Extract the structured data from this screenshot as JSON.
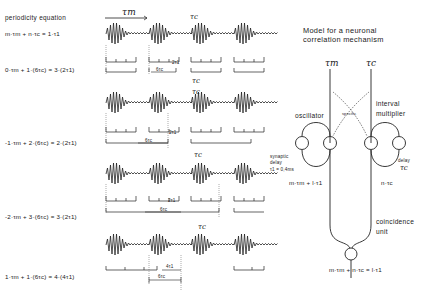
{
  "left_panel": {
    "heading": "periodicity equation",
    "general_equation": "m·τm + n·τc = 1·τ1",
    "rows": [
      {
        "equation": "0·τm + 1·(6τc) = 3·(2τ1)",
        "delta_label": "2τ1",
        "span_label": "6τc",
        "top_marker": "τc",
        "bottom_marker": "τc"
      },
      {
        "equation": "-1·τm + 2·(6τc) = 2·(2τ1)",
        "delta_label": "2τ1",
        "span_label": "6τc",
        "top_marker": "τc",
        "bottom_marker": "τc"
      },
      {
        "equation": "-2·τm + 3·(6τc) = 3·(2τ1)",
        "delta_label": "2τ1",
        "span_label": "6τc",
        "top_marker": "",
        "bottom_marker": "τc"
      },
      {
        "equation": "1·τm + 1·(6τc) = 4·(4τ1)",
        "delta_label": "4τ1",
        "span_label": "6τc",
        "top_marker": "",
        "bottom_marker": ""
      }
    ],
    "period_label_top": "τm",
    "period_label_top_carrier": "τc"
  },
  "model": {
    "title_line1": "Model for a neuronal",
    "title_line2": "correlation mechanism",
    "input_left": "τm",
    "input_right": "τc",
    "oscillator_label": "oscillator",
    "interval_label_1": "interval",
    "interval_label_2": "multiplier",
    "specific_label": "specific",
    "synaptic_1": "synaptic",
    "synaptic_2": "delay",
    "synaptic_3": "τ1 = 0,4ms",
    "delay_label": "delay",
    "delay_tau": "τc",
    "left_output": "m·τm + l·τ1",
    "right_output": "n·τc",
    "coincidence_1": "coincidence",
    "coincidence_2": "unit",
    "final_output": "m·τm + n·τc = l·τ1"
  }
}
